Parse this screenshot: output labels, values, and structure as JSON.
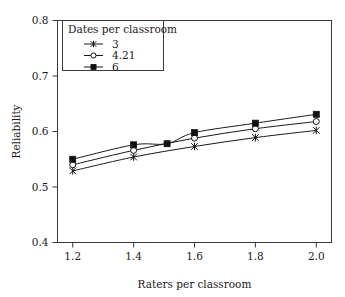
{
  "chart_data": {
    "type": "line",
    "title": "",
    "xlabel": "Raters per classroom",
    "ylabel": "Reliability",
    "xlim": [
      1.15,
      2.05
    ],
    "ylim": [
      0.4,
      0.8
    ],
    "xticks": [
      "1.2",
      "1.4",
      "1.6",
      "1.8",
      "2.0"
    ],
    "xtick_values": [
      1.2,
      1.4,
      1.6,
      1.8,
      2.0
    ],
    "yticks": [
      "0.4",
      "0.5",
      "0.6",
      "0.7",
      "0.8"
    ],
    "ytick_values": [
      0.4,
      0.5,
      0.6,
      0.7,
      0.8
    ],
    "grid": false,
    "legend_position": "top-left",
    "legend_title": "Dates per classroom",
    "series": [
      {
        "name": "3",
        "marker": "cross",
        "x": [
          1.2,
          1.4,
          1.6,
          1.8,
          2.0
        ],
        "values": [
          0.529,
          0.554,
          0.573,
          0.589,
          0.602
        ]
      },
      {
        "name": "4.21",
        "marker": "open-circle",
        "x": [
          1.2,
          1.4,
          1.6,
          1.8,
          2.0
        ],
        "values": [
          0.54,
          0.566,
          0.588,
          0.605,
          0.618
        ]
      },
      {
        "name": "6",
        "marker": "filled-square",
        "x": [
          1.2,
          1.4,
          1.51,
          1.6,
          1.8,
          2.0
        ],
        "values": [
          0.55,
          0.576,
          0.578,
          0.598,
          0.615,
          0.631
        ]
      }
    ]
  },
  "legend": {
    "title": "Dates per classroom",
    "entries": [
      {
        "label": "3",
        "marker": "cross-icon"
      },
      {
        "label": "4.21",
        "marker": "open-circle-icon"
      },
      {
        "label": "6",
        "marker": "filled-square-icon"
      }
    ]
  },
  "axes": {
    "x_title": "Raters per classroom",
    "y_title": "Reliability"
  },
  "colors": {
    "line": "#1a1a1a",
    "frame": "#3a3a3a",
    "background": "#ffffff",
    "marker_fill": "#111111",
    "marker_open_fill": "#ffffff"
  }
}
